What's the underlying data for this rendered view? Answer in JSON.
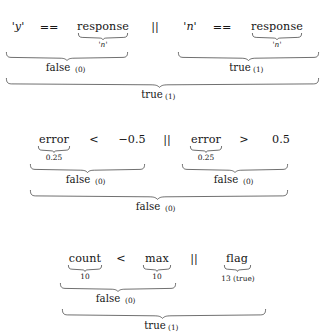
{
  "figure": {
    "kind": "boolean-expression-evaluation-trees",
    "ink_color": "#161616",
    "background_color": "#ffffff"
  },
  "blocks": [
    {
      "id": "block-1",
      "expression": "'y' == response || 'n' == response",
      "tokens": [
        {
          "text": "'y'",
          "style": "math-italic"
        },
        {
          "text": "==",
          "style": "operator"
        },
        {
          "text": "response",
          "style": "identifier"
        },
        {
          "text": "||",
          "style": "operator"
        },
        {
          "text": "'n'",
          "style": "math-italic"
        },
        {
          "text": "==",
          "style": "operator"
        },
        {
          "text": "response",
          "style": "identifier"
        }
      ],
      "leaf_annotations": [
        {
          "target": "response (left)",
          "value": "'n'"
        },
        {
          "target": "response (right)",
          "value": "'n'"
        }
      ],
      "subresults": [
        {
          "label": "false",
          "value": "(0)"
        },
        {
          "label": "true",
          "value": "(1)"
        }
      ],
      "final": {
        "label": "true",
        "value": "(1)"
      }
    },
    {
      "id": "block-2",
      "expression": "error < -0.5 || error > 0.5",
      "tokens": [
        {
          "text": "error",
          "style": "identifier"
        },
        {
          "text": "<",
          "style": "operator"
        },
        {
          "text": "−0.5",
          "style": "number"
        },
        {
          "text": "||",
          "style": "operator"
        },
        {
          "text": "error",
          "style": "identifier"
        },
        {
          "text": ">",
          "style": "operator"
        },
        {
          "text": "0.5",
          "style": "number"
        }
      ],
      "leaf_annotations": [
        {
          "target": "error (left)",
          "value": "0.25"
        },
        {
          "target": "error (right)",
          "value": "0.25"
        }
      ],
      "subresults": [
        {
          "label": "false",
          "value": "(0)"
        },
        {
          "label": "false",
          "value": "(0)"
        }
      ],
      "final": {
        "label": "false",
        "value": "(0)"
      }
    },
    {
      "id": "block-3",
      "expression": "count < max || flag",
      "tokens": [
        {
          "text": "count",
          "style": "identifier"
        },
        {
          "text": "<",
          "style": "operator"
        },
        {
          "text": "max",
          "style": "identifier"
        },
        {
          "text": "||",
          "style": "operator"
        },
        {
          "text": "flag",
          "style": "identifier"
        }
      ],
      "leaf_annotations": [
        {
          "target": "count",
          "value": "10"
        },
        {
          "target": "max",
          "value": "10"
        },
        {
          "target": "flag",
          "value": "13 (true)"
        }
      ],
      "subresults": [
        {
          "label": "false",
          "value": "(0)"
        }
      ],
      "final": {
        "label": "true",
        "value": "(1)"
      }
    }
  ],
  "text": {
    "b1": {
      "t1": "'y'",
      "t2": "==",
      "t3": "response",
      "t4": "||",
      "t5": "'n'",
      "t6": "==",
      "t7": "response",
      "leaf_left": "'n'",
      "leaf_right": "'n'",
      "sub_left_word": "false",
      "sub_left_val": "(0)",
      "sub_right_word": "true",
      "sub_right_val": "(1)",
      "final_word": "true",
      "final_val": "(1)"
    },
    "b2": {
      "t1": "error",
      "t2": "<",
      "t3": "−0.5",
      "t4": "||",
      "t5": "error",
      "t6": ">",
      "t7": "0.5",
      "leaf_left": "0.25",
      "leaf_right": "0.25",
      "sub_left_word": "false",
      "sub_left_val": "(0)",
      "sub_right_word": "false",
      "sub_right_val": "(0)",
      "final_word": "false",
      "final_val": "(0)"
    },
    "b3": {
      "t1": "count",
      "t2": "<",
      "t3": "max",
      "t4": "||",
      "t5": "flag",
      "leaf_count": "10",
      "leaf_max": "10",
      "leaf_flag": "13 (true)",
      "sub_left_word": "false",
      "sub_left_val": "(0)",
      "final_word": "true",
      "final_val": "(1)"
    }
  }
}
